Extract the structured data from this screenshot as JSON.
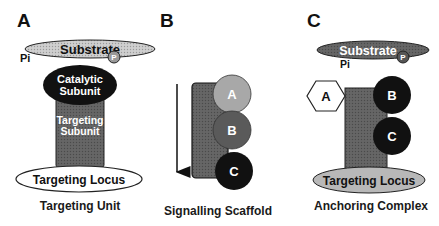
{
  "panels": [
    {
      "letter": "A",
      "caption": "Targeting Unit",
      "substrate": "Substrate",
      "phospho": "P",
      "pi": "Pi",
      "catalytic": [
        "Catalytic",
        "Subunit"
      ],
      "targeting_subunit": [
        "Targeting",
        "Subunit"
      ],
      "locus": "Targeting Locus"
    },
    {
      "letter": "B",
      "caption": "Signalling Scaffold",
      "nodes": [
        "A",
        "B",
        "C"
      ]
    },
    {
      "letter": "C",
      "caption": "Anchoring Complex",
      "substrate": "Substrate",
      "phospho": "P",
      "pi": "Pi",
      "nodes": [
        "A",
        "B",
        "C"
      ],
      "locus": "Targeting Locus"
    }
  ],
  "colors": {
    "substrate_fill": "#c8c8c8",
    "dark_fill": "#111111",
    "bar_fill": "#5c5c5c",
    "circle_A": "#a8a8a8",
    "circle_B": "#5a5a5a",
    "locus_gray": "#b8b8b8"
  }
}
